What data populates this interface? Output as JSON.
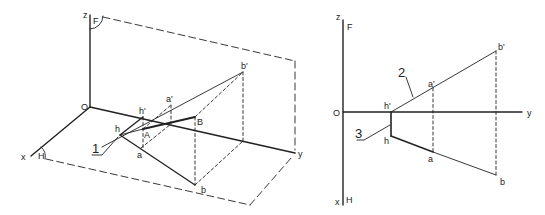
{
  "figure": {
    "left": {
      "name": "3D axonometric view of line AB and its horizontal trace h",
      "labels": {
        "z": "z",
        "O": "O",
        "x": "x",
        "y": "y",
        "F": "F",
        "H": "H",
        "b_prime": "b'",
        "a_prime": "a'",
        "h_prime": "h'",
        "h": "h",
        "A": "A",
        "B": "B",
        "a": "a",
        "b": "b",
        "callout_1": "1"
      }
    },
    "right": {
      "name": "Orthographic (Monge) projection of line and its trace",
      "labels": {
        "z": "z",
        "F": "F",
        "O": "O",
        "y": "y",
        "x": "x",
        "H": "H",
        "h_prime": "h'",
        "h": "h",
        "a_prime": "a'",
        "a": "a",
        "b_prime": "b'",
        "b": "b",
        "callout_2": "2",
        "callout_3": "3"
      }
    },
    "colors": {
      "ink": "#222222",
      "background": "#ffffff"
    }
  }
}
